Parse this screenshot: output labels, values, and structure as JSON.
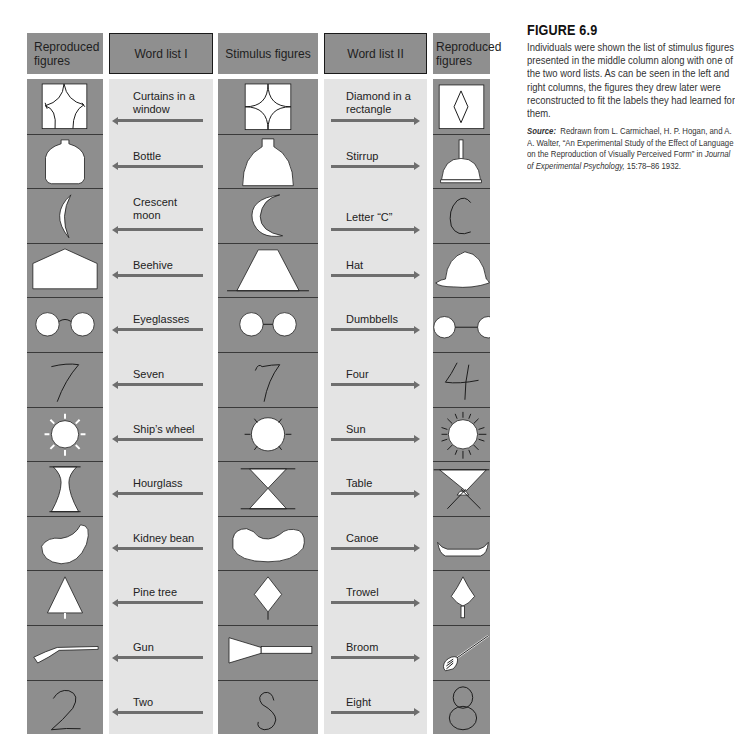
{
  "headers": {
    "reproduced_left": "Reproduced figures",
    "word_list_1": "Word list I",
    "stimulus": "Stimulus figures",
    "word_list_2": "Word list II",
    "reproduced_right": "Reproduced figures"
  },
  "rows": [
    {
      "word1": "Curtains in a window",
      "stimulus": "diamond-in-rectangle",
      "word2": "Diamond in a rectangle",
      "repro_left": "curtains-in-window",
      "repro_right": "diamond-in-rectangle"
    },
    {
      "word1": "Bottle",
      "stimulus": "bell-shape",
      "word2": "Stirrup",
      "repro_left": "bottle",
      "repro_right": "stirrup"
    },
    {
      "word1": "Crescent moon",
      "stimulus": "crescent",
      "word2": "Letter “C”",
      "repro_left": "crescent-moon",
      "repro_right": "letter-c"
    },
    {
      "word1": "Beehive",
      "stimulus": "trapezoid",
      "word2": "Hat",
      "repro_left": "beehive",
      "repro_right": "hat"
    },
    {
      "word1": "Eyeglasses",
      "stimulus": "two-circles-joined",
      "word2": "Dumbbells",
      "repro_left": "eyeglasses",
      "repro_right": "dumbbells"
    },
    {
      "word1": "Seven",
      "stimulus": "seven-like-figure",
      "word2": "Four",
      "repro_left": "seven",
      "repro_right": "four"
    },
    {
      "word1": "Ship’s wheel",
      "stimulus": "circle-with-rays",
      "word2": "Sun",
      "repro_left": "ships-wheel",
      "repro_right": "sun"
    },
    {
      "word1": "Hourglass",
      "stimulus": "two-triangles",
      "word2": "Table",
      "repro_left": "hourglass",
      "repro_right": "table"
    },
    {
      "word1": "Kidney bean",
      "stimulus": "curved-blob",
      "word2": "Canoe",
      "repro_left": "kidney-bean",
      "repro_right": "canoe"
    },
    {
      "word1": "Pine tree",
      "stimulus": "diamond-on-stem",
      "word2": "Trowel",
      "repro_left": "pine-tree",
      "repro_right": "trowel"
    },
    {
      "word1": "Gun",
      "stimulus": "triangle-with-bar",
      "word2": "Broom",
      "repro_left": "gun",
      "repro_right": "broom"
    },
    {
      "word1": "Two",
      "stimulus": "s-like-curve",
      "word2": "Eight",
      "repro_left": "two",
      "repro_right": "eight"
    }
  ],
  "caption": {
    "title": "FIGURE 6.9",
    "body": "Individuals were shown the list of stimulus figures presented in the middle column along with one of the two word lists. As can be seen in the left and right columns, the figures they drew later were reconstructed to fit the labels they had learned for them.",
    "source_label": "Source:",
    "source_text_1": "Redrawn from L. Carmichael, H. P. Hogan, and A. A. Walter, “An Experimental Study of the Effect of Language on the Reproduction of Visually Perceived Form” in ",
    "source_journal": "Journal of Experimental Psychology,",
    "source_text_2": " 15:78–86 1932."
  },
  "colors": {
    "figure_column": "#8e8e8e",
    "word_column": "#e4e4e4",
    "header_box": "#8f8f8f",
    "arrow": "#6e6e6e"
  }
}
